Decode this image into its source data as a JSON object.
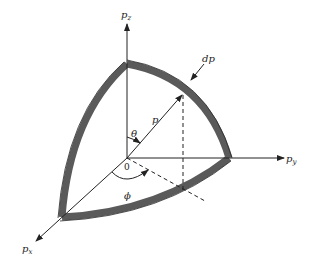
{
  "diagram": {
    "type": "momentum-space spherical shell octant",
    "axes": {
      "z": {
        "label": "p",
        "sub": "z"
      },
      "y": {
        "label": "p",
        "sub": "y"
      },
      "x": {
        "label": "p",
        "sub": "x"
      }
    },
    "labels": {
      "radius": "p",
      "thickness": "dp",
      "polar_angle": "θ",
      "azimuth_angle": "ϕ",
      "origin": "0"
    },
    "colors": {
      "line": "#222222",
      "shell_fill": "#5a5a5a",
      "background": "#ffffff"
    }
  }
}
